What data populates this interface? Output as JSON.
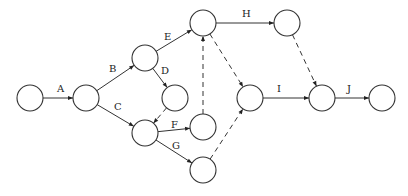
{
  "diagram": {
    "type": "activity-on-arrow network",
    "node_radius": 13,
    "nodes": [
      {
        "id": "n1",
        "x": 30,
        "y": 98
      },
      {
        "id": "n2",
        "x": 86,
        "y": 98
      },
      {
        "id": "n3",
        "x": 145,
        "y": 58
      },
      {
        "id": "n4",
        "x": 175,
        "y": 98
      },
      {
        "id": "n5",
        "x": 203,
        "y": 23
      },
      {
        "id": "n6",
        "x": 145,
        "y": 133
      },
      {
        "id": "n7",
        "x": 203,
        "y": 127
      },
      {
        "id": "n8",
        "x": 203,
        "y": 170
      },
      {
        "id": "n9",
        "x": 250,
        "y": 98
      },
      {
        "id": "n10",
        "x": 287,
        "y": 23
      },
      {
        "id": "n11",
        "x": 322,
        "y": 98
      },
      {
        "id": "n12",
        "x": 382,
        "y": 98
      }
    ],
    "activities": [
      {
        "label": "A",
        "from": "n1",
        "to": "n2",
        "lx": 57,
        "ly": 92
      },
      {
        "label": "B",
        "from": "n2",
        "to": "n3",
        "lx": 109,
        "ly": 72
      },
      {
        "label": "C",
        "from": "n2",
        "to": "n6",
        "lx": 114,
        "ly": 110
      },
      {
        "label": "D",
        "from": "n3",
        "to": "n4",
        "lx": 161,
        "ly": 74
      },
      {
        "label": "E",
        "from": "n3",
        "to": "n5",
        "lx": 164,
        "ly": 40
      },
      {
        "label": "F",
        "from": "n6",
        "to": "n7",
        "lx": 171,
        "ly": 128
      },
      {
        "label": "G",
        "from": "n6",
        "to": "n8",
        "lx": 172,
        "ly": 149
      },
      {
        "label": "H",
        "from": "n5",
        "to": "n10",
        "lx": 242,
        "ly": 17
      },
      {
        "label": "I",
        "from": "n9",
        "to": "n11",
        "lx": 277,
        "ly": 92
      },
      {
        "label": "J",
        "from": "n11",
        "to": "n12",
        "lx": 347,
        "ly": 92
      }
    ],
    "dummies": [
      {
        "from": "n4",
        "to": "n6"
      },
      {
        "from": "n7",
        "to": "n5"
      },
      {
        "from": "n5",
        "to": "n9"
      },
      {
        "from": "n8",
        "to": "n9"
      },
      {
        "from": "n10",
        "to": "n11"
      }
    ]
  }
}
